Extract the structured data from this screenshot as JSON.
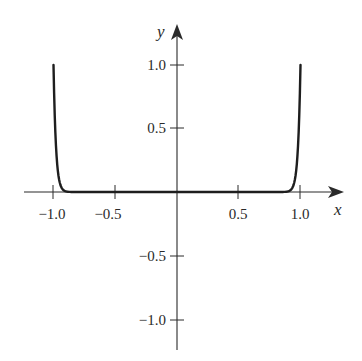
{
  "chart_data": {
    "type": "line",
    "title": "",
    "xlabel": "x",
    "ylabel": "y",
    "xlim": [
      -1.2,
      1.2
    ],
    "ylim": [
      -1.25,
      1.25
    ],
    "grid": false,
    "legend": null,
    "x_ticks": [
      -1.0,
      -0.5,
      0.5,
      1.0
    ],
    "x_tick_labels": [
      "−1.0",
      "−0.5",
      "0.5",
      "1.0"
    ],
    "y_ticks": [
      1.0,
      0.5,
      -0.5,
      -1.0
    ],
    "y_tick_labels": [
      "1.0",
      "0.5",
      "−0.5",
      "−1.0"
    ],
    "series": [
      {
        "name": "curve",
        "description": "even high-power curve, ~0 on (-0.9, 0.9), rising steeply to 1.0 at x = ±1",
        "x": [
          -1.0,
          -0.98,
          -0.96,
          -0.94,
          -0.92,
          -0.9,
          -0.85,
          -0.5,
          0.0,
          0.5,
          0.85,
          0.9,
          0.92,
          0.94,
          0.96,
          0.98,
          1.0
        ],
        "y": [
          1.0,
          0.36,
          0.13,
          0.05,
          0.02,
          0.005,
          0.0,
          0.0,
          0.0,
          0.0,
          0.0,
          0.005,
          0.02,
          0.05,
          0.13,
          0.36,
          1.0
        ]
      }
    ]
  },
  "labels": {
    "x_axis": "x",
    "y_axis": "y",
    "x_ticks": [
      "−1.0",
      "−0.5",
      "0.5",
      "1.0"
    ],
    "y_ticks": [
      "1.0",
      "0.5",
      "−0.5",
      "−1.0"
    ]
  },
  "colors": {
    "ink": "#2a2a2a",
    "background": "#ffffff"
  }
}
